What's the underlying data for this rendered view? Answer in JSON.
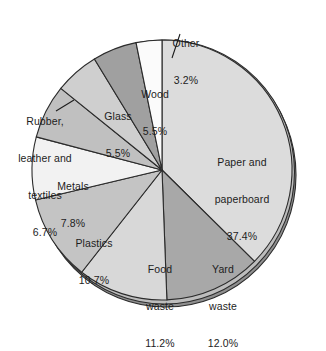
{
  "chart_data": {
    "type": "pie",
    "title": "",
    "subtitle": "",
    "xlabel": "",
    "ylabel": "",
    "legend_position": "none",
    "grid": false,
    "label_format": "name + percent",
    "total_percent": 100.0,
    "start_angle_deg": -90,
    "direction": "clockwise",
    "categories": [
      "Paper and paperboard",
      "Yard waste",
      "Food waste",
      "Plastics",
      "Metals",
      "Rubber, leather and textiles",
      "Glass",
      "Wood",
      "Other"
    ],
    "values": [
      37.4,
      12.0,
      11.2,
      10.7,
      7.8,
      6.7,
      5.5,
      5.5,
      3.2
    ],
    "colors": [
      "#dcdcdc",
      "#a8a8a8",
      "#d8d8d8",
      "#c4c4c4",
      "#f2f2f2",
      "#c0c0c0",
      "#cfcfcf",
      "#a0a0a0",
      "#fbfbfb"
    ],
    "slices": [
      {
        "name": "Paper and paperboard",
        "percent": 37.4,
        "percent_label": "37.4%",
        "color": "#dcdcdc",
        "label_placement": "inside"
      },
      {
        "name": "Yard waste",
        "percent": 12.0,
        "percent_label": "12.0%",
        "color": "#a8a8a8",
        "label_placement": "inside"
      },
      {
        "name": "Food waste",
        "percent": 11.2,
        "percent_label": "11.2%",
        "color": "#d8d8d8",
        "label_placement": "inside"
      },
      {
        "name": "Plastics",
        "percent": 10.7,
        "percent_label": "10.7%",
        "color": "#c4c4c4",
        "label_placement": "inside"
      },
      {
        "name": "Metals",
        "percent": 7.8,
        "percent_label": "7.8%",
        "color": "#f2f2f2",
        "label_placement": "inside"
      },
      {
        "name": "Rubber, leather and textiles",
        "percent": 6.7,
        "percent_label": "6.7%",
        "color": "#c0c0c0",
        "label_placement": "outside-leader"
      },
      {
        "name": "Glass",
        "percent": 5.5,
        "percent_label": "5.5%",
        "color": "#cfcfcf",
        "label_placement": "inside"
      },
      {
        "name": "Wood",
        "percent": 5.5,
        "percent_label": "5.5%",
        "color": "#a0a0a0",
        "label_placement": "inside"
      },
      {
        "name": "Other",
        "percent": 3.2,
        "percent_label": "3.2%",
        "color": "#fbfbfb",
        "label_placement": "outside-leader"
      }
    ]
  },
  "labels": {
    "other": {
      "line1": "Other",
      "line2": "3.2%",
      "line3": ""
    },
    "wood": {
      "line1": "Wood",
      "line2": "5.5%",
      "line3": ""
    },
    "glass": {
      "line1": "Glass",
      "line2": "5.5%",
      "line3": ""
    },
    "rubber": {
      "line1": "Rubber,",
      "line2": "leather and",
      "line3": "textiles",
      "line4": "6.7%"
    },
    "metals": {
      "line1": "Metals",
      "line2": "7.8%",
      "line3": ""
    },
    "plastics": {
      "line1": "Plastics",
      "line2": "10.7%",
      "line3": ""
    },
    "food": {
      "line1": "Food",
      "line2": "waste",
      "line3": "11.2%"
    },
    "yard": {
      "line1": "Yard",
      "line2": "waste",
      "line3": "12.0%"
    },
    "paper": {
      "line1": "Paper and",
      "line2": "paperboard",
      "line3": "37.4%"
    }
  },
  "style": {
    "background": "#ffffff",
    "text_color": "#1d1d1d",
    "slice_border": "#2b2b2b",
    "shadow_color": "#8c8c8c"
  }
}
